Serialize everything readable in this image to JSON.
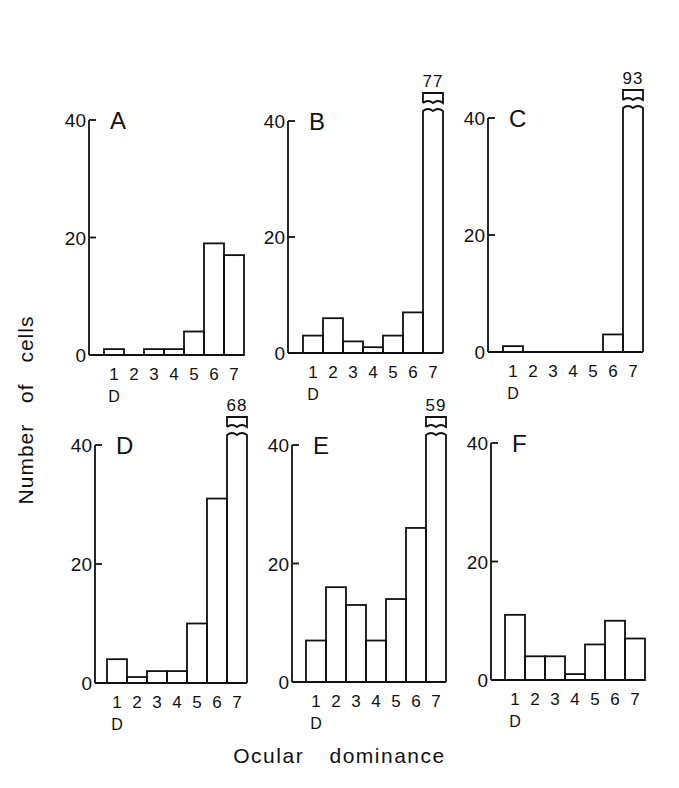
{
  "figure": {
    "ylabel": "Number of cells",
    "xlabel": "Ocular dominance"
  },
  "chart_data": [
    {
      "type": "bar",
      "panel": "A",
      "categories": [
        "1",
        "2",
        "3",
        "4",
        "5",
        "6",
        "7"
      ],
      "values": [
        1,
        0,
        1,
        1,
        4,
        19,
        17
      ],
      "ylim": [
        0,
        40
      ],
      "yticks": [
        0,
        20,
        40
      ],
      "xnote": "D",
      "break_label": null
    },
    {
      "type": "bar",
      "panel": "B",
      "categories": [
        "1",
        "2",
        "3",
        "4",
        "5",
        "6",
        "7"
      ],
      "values": [
        3,
        6,
        2,
        1,
        3,
        7,
        77
      ],
      "ylim": [
        0,
        40
      ],
      "yticks": [
        0,
        20,
        40
      ],
      "xnote": "D",
      "break_label": "77"
    },
    {
      "type": "bar",
      "panel": "C",
      "categories": [
        "1",
        "2",
        "3",
        "4",
        "5",
        "6",
        "7"
      ],
      "values": [
        1,
        0,
        0,
        0,
        0,
        3,
        93
      ],
      "ylim": [
        0,
        40
      ],
      "yticks": [
        0,
        20,
        40
      ],
      "xnote": "D",
      "break_label": "93"
    },
    {
      "type": "bar",
      "panel": "D",
      "categories": [
        "1",
        "2",
        "3",
        "4",
        "5",
        "6",
        "7"
      ],
      "values": [
        4,
        1,
        2,
        2,
        10,
        31,
        68
      ],
      "ylim": [
        0,
        40
      ],
      "yticks": [
        0,
        20,
        40
      ],
      "xnote": "D",
      "break_label": "68"
    },
    {
      "type": "bar",
      "panel": "E",
      "categories": [
        "1",
        "2",
        "3",
        "4",
        "5",
        "6",
        "7"
      ],
      "values": [
        7,
        16,
        13,
        7,
        14,
        26,
        59
      ],
      "ylim": [
        0,
        40
      ],
      "yticks": [
        0,
        20,
        40
      ],
      "xnote": "D",
      "break_label": "59"
    },
    {
      "type": "bar",
      "panel": "F",
      "categories": [
        "1",
        "2",
        "3",
        "4",
        "5",
        "6",
        "7"
      ],
      "values": [
        11,
        4,
        4,
        1,
        6,
        10,
        7
      ],
      "ylim": [
        0,
        40
      ],
      "yticks": [
        0,
        20,
        40
      ],
      "xnote": "D",
      "break_label": null
    }
  ]
}
